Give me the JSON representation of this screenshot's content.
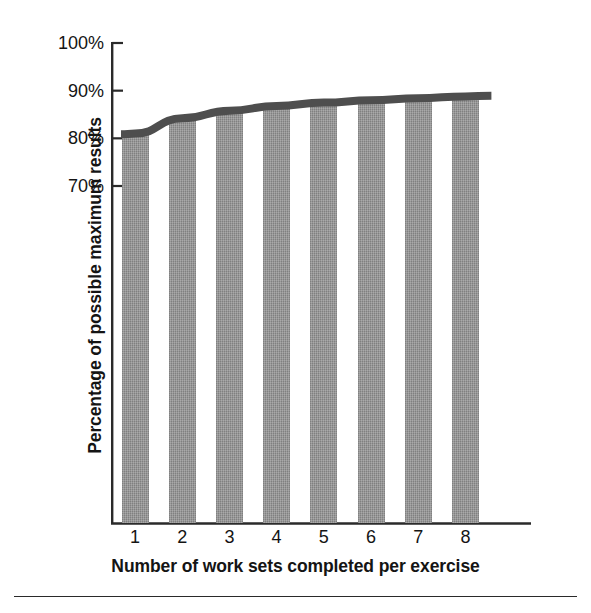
{
  "chart_data": {
    "type": "bar",
    "title": "",
    "subtitle": "",
    "xlabel": "Number of work sets completed per exercise",
    "ylabel": "Percentage of possible maximum results",
    "categories": [
      "1",
      "2",
      "3",
      "4",
      "5",
      "6",
      "7",
      "8"
    ],
    "values": [
      81,
      84,
      86,
      87,
      87.5,
      88,
      88.5,
      89
    ],
    "series": [
      {
        "name": "Percentage of possible maximum results",
        "type": "bar",
        "values": [
          81,
          84,
          86,
          87,
          87.5,
          88,
          88.5,
          89
        ]
      },
      {
        "name": "Trend curve",
        "type": "line",
        "values": [
          81,
          84.2,
          85.8,
          86.8,
          87.5,
          88,
          88.4,
          88.8
        ]
      }
    ],
    "ylim": [
      60,
      100
    ],
    "yticks": [
      70,
      100
    ],
    "ytick_labels": [
      "70%",
      "80%",
      "90%",
      "100%"
    ],
    "ytick_values": [
      70,
      80,
      90,
      100
    ],
    "xlim": [
      0.4,
      8.9
    ],
    "grid": false,
    "legend": false,
    "legend_position": "none",
    "axis_color": "#2a2a2a",
    "bar_color": "#8e8e8e",
    "line_color": "#4a4a4a",
    "background_color": "#ffffff"
  },
  "axes": {
    "y_tick_labels": [
      {
        "text": "100%",
        "value": 100
      },
      {
        "text": "90%",
        "value": 90
      },
      {
        "text": "80%",
        "value": 80
      },
      {
        "text": "70%",
        "value": 70
      }
    ],
    "x_tick_labels": [
      {
        "text": "1",
        "value": 1
      },
      {
        "text": "2",
        "value": 2
      },
      {
        "text": "3",
        "value": 3
      },
      {
        "text": "4",
        "value": 4
      },
      {
        "text": "5",
        "value": 5
      },
      {
        "text": "6",
        "value": 6
      },
      {
        "text": "7",
        "value": 7
      },
      {
        "text": "8",
        "value": 8
      }
    ],
    "y_title": "Percentage of possible maximum results",
    "x_title": "Number of work sets completed per exercise"
  }
}
